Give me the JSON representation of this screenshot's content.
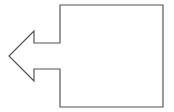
{
  "diagram": {
    "shape": {
      "type": "left-arrow-callout",
      "label": "",
      "stroke_color": "#555555",
      "fill_color": "#ffffff"
    }
  }
}
